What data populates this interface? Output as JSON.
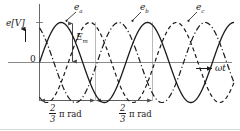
{
  "figure": {
    "axis": {
      "y_label": "e[V]",
      "x_label": "ωt",
      "origin_label": "0",
      "amplitude_label": "E",
      "amplitude_sub": "m"
    },
    "curves": [
      {
        "key": "ea",
        "label": "e",
        "sub": "a",
        "style": "solid",
        "phase_deg": 0,
        "color": "#1a1a1a"
      },
      {
        "key": "eb",
        "label": "e",
        "sub": "b",
        "style": "dashed",
        "phase_deg": -120,
        "color": "#1a1a1a"
      },
      {
        "key": "ec",
        "label": "e",
        "sub": "c",
        "style": "dash-dot",
        "phase_deg": -240,
        "color": "#1a1a1a"
      }
    ],
    "dimensions": [
      {
        "numerator": "2",
        "denominator": "3",
        "unit": "π rad"
      },
      {
        "numerator": "2",
        "denominator": "3",
        "unit": "π rad"
      }
    ]
  },
  "chart_data": {
    "type": "line",
    "title": "",
    "xlabel": "ωt",
    "ylabel": "e[V]",
    "xlim": [
      0,
      810
    ],
    "ylim": [
      -1.15,
      1.15
    ],
    "grid": false,
    "legend_position": "inline-annotations",
    "x_unit": "degrees",
    "series": [
      {
        "name": "e_a",
        "phase_deg": 0,
        "amplitude": 1.0,
        "style": "solid"
      },
      {
        "name": "e_b",
        "phase_deg": -120,
        "amplitude": 1.0,
        "style": "dashed"
      },
      {
        "name": "e_c",
        "phase_deg": -240,
        "amplitude": 1.0,
        "style": "dash-dot"
      }
    ],
    "annotations": [
      {
        "text": "E_m",
        "meaning": "peak amplitude",
        "at_deg": 90
      },
      {
        "text": "2/3 π rad",
        "meaning": "phase shift between e_a and e_b",
        "span_deg": [
          90,
          210
        ]
      },
      {
        "text": "2/3 π rad",
        "meaning": "phase shift between e_b and e_c",
        "span_deg": [
          210,
          330
        ]
      }
    ]
  }
}
